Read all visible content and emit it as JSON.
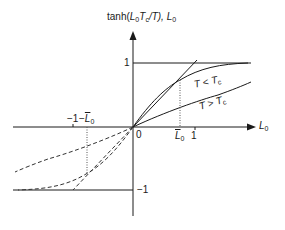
{
  "diagram": {
    "y_axis_label": {
      "prefix": "tanh(",
      "L": "L",
      "L_sub": "0",
      "T": "T",
      "T_sub": "c",
      "after": "/T), ",
      "L2": "L",
      "L2_sub": "0"
    },
    "x_axis_label": {
      "L": "L",
      "sub": "0"
    },
    "ticks": {
      "y_pos_one": "1",
      "y_neg_one": "−1",
      "origin": "0",
      "x_one": "1",
      "x_neg_one": "−1",
      "x_Lbar": {
        "L": "L",
        "sub": "0"
      },
      "x_neg_Lbar": {
        "minus": "−",
        "L": "L",
        "sub": "0"
      }
    },
    "curves": [
      {
        "name": "T < Tc",
        "label": {
          "T": "T",
          "op": " < ",
          "Tc": "T",
          "sub": "c"
        }
      },
      {
        "name": "T > Tc",
        "label": {
          "T": "T",
          "op": " > ",
          "Tc": "T",
          "sub": "c"
        }
      }
    ],
    "colors": {
      "line": "#1a1a1a",
      "dashed": "#333333",
      "dotted": "#555555"
    }
  }
}
